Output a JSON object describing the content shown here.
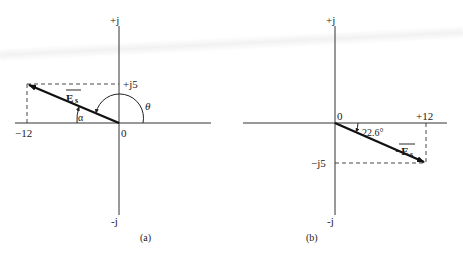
{
  "diagrams": [
    {
      "id": "a",
      "caption": "(a)",
      "axes": {
        "pos_imag": "+j",
        "neg_imag": "-j",
        "origin": "0"
      },
      "ticks": {
        "real": "−12",
        "imag": "+j5"
      },
      "vector": {
        "label": "E",
        "subscript": "s",
        "overbar": true,
        "from": [
          0,
          0
        ],
        "to": [
          -12,
          5
        ]
      },
      "angles": {
        "alpha": "α",
        "theta": "θ"
      }
    },
    {
      "id": "b",
      "caption": "(b)",
      "axes": {
        "pos_imag": "+j",
        "neg_imag": "-j",
        "origin": "0"
      },
      "ticks": {
        "real": "+12",
        "imag": "−j5"
      },
      "vector": {
        "label": "−E",
        "subscript": "s",
        "overbar": true,
        "from": [
          0,
          0
        ],
        "to": [
          12,
          -5
        ]
      },
      "angles": {
        "angle": "22.6°"
      }
    }
  ]
}
